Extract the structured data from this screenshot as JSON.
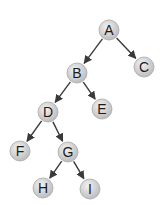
{
  "diagram": {
    "type": "binary-tree",
    "colors": {
      "node_fill_light": "#f2f2f2",
      "node_fill_dark": "#bdbdbd",
      "node_stroke": "#a8a8a8",
      "edge": "#3a3a3a",
      "label": "#1a1a1a"
    },
    "nodes": [
      {
        "id": "A",
        "label": "A"
      },
      {
        "id": "B",
        "label": "B"
      },
      {
        "id": "C",
        "label": "C"
      },
      {
        "id": "D",
        "label": "D"
      },
      {
        "id": "E",
        "label": "E"
      },
      {
        "id": "F",
        "label": "F"
      },
      {
        "id": "G",
        "label": "G"
      },
      {
        "id": "H",
        "label": "H"
      },
      {
        "id": "I",
        "label": "I"
      }
    ],
    "edges": [
      {
        "from": "A",
        "to": "B"
      },
      {
        "from": "A",
        "to": "C"
      },
      {
        "from": "B",
        "to": "D"
      },
      {
        "from": "B",
        "to": "E"
      },
      {
        "from": "D",
        "to": "F"
      },
      {
        "from": "D",
        "to": "G"
      },
      {
        "from": "G",
        "to": "H"
      },
      {
        "from": "G",
        "to": "I"
      }
    ]
  }
}
